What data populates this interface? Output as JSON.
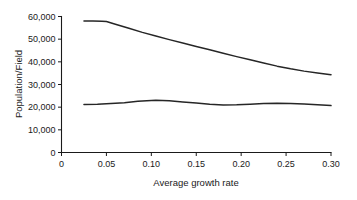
{
  "chart_data": {
    "type": "line",
    "title": "",
    "xlabel": "Average growth rate",
    "ylabel": "Population/Field",
    "xlim": [
      0,
      0.3
    ],
    "ylim": [
      0,
      60000
    ],
    "grid": false,
    "legend": "none",
    "xticks": [
      0,
      0.05,
      0.1,
      0.15,
      0.2,
      0.25,
      0.3
    ],
    "xtick_labels": [
      "0",
      "0.05",
      "0.10",
      "0.15",
      "0.20",
      "0.25",
      "0.30"
    ],
    "yticks": [
      0,
      10000,
      20000,
      30000,
      40000,
      50000,
      60000
    ],
    "ytick_labels": [
      "0",
      "10,000",
      "20,000",
      "30,000",
      "40,000",
      "50,000",
      "60,000"
    ],
    "series": [
      {
        "name": "upper-curve",
        "color": "#262626",
        "x": [
          0.025,
          0.035,
          0.045,
          0.05,
          0.06,
          0.075,
          0.09,
          0.105,
          0.12,
          0.135,
          0.15,
          0.165,
          0.18,
          0.195,
          0.21,
          0.225,
          0.24,
          0.255,
          0.27,
          0.285,
          0.3
        ],
        "values": [
          58000,
          58000,
          57900,
          57800,
          56600,
          54800,
          53000,
          51400,
          49800,
          48300,
          46800,
          45300,
          43800,
          42300,
          40900,
          39500,
          38100,
          36900,
          35900,
          35100,
          34300
        ]
      },
      {
        "name": "lower-curve",
        "color": "#262626",
        "x": [
          0.025,
          0.04,
          0.055,
          0.07,
          0.085,
          0.1,
          0.105,
          0.12,
          0.135,
          0.15,
          0.165,
          0.18,
          0.195,
          0.21,
          0.225,
          0.24,
          0.255,
          0.27,
          0.285,
          0.3
        ],
        "values": [
          21200,
          21300,
          21600,
          22000,
          22600,
          22950,
          23000,
          22800,
          22300,
          21800,
          21250,
          21000,
          21050,
          21300,
          21600,
          21700,
          21650,
          21450,
          21100,
          20700
        ]
      }
    ]
  },
  "axes": {
    "y_title": "Population/Field",
    "x_title": "Average growth rate"
  }
}
